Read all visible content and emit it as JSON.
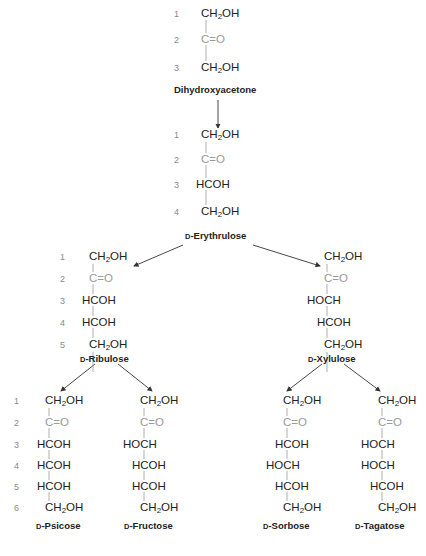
{
  "colors": {
    "text": "#222222",
    "carbonyl": "#9a9a9a",
    "carbon_numbers": "#8a8a8a",
    "arrow": "#333333"
  },
  "nodes": {
    "dihydroxyacetone": {
      "name": "Dihydroxyacetone",
      "prefix": "",
      "carbons": 3,
      "rows": [
        "CH2OH",
        "C=O",
        "CH2OH"
      ]
    },
    "erythrulose": {
      "name": "-Erythrulose",
      "prefix": "D",
      "carbons": 4,
      "rows": [
        "CH2OH",
        "C=O",
        "HCOH",
        "CH2OH"
      ]
    },
    "ribulose": {
      "name": "-Ribulose",
      "prefix": "D",
      "carbons": 5,
      "rows": [
        "CH2OH",
        "C=O",
        "HCOH",
        "HCOH",
        "CH2OH"
      ]
    },
    "xylulose": {
      "name": "-Xylulose",
      "prefix": "D",
      "carbons": 5,
      "rows": [
        "CH2OH",
        "C=O",
        "HOCH",
        "HCOH",
        "CH2OH"
      ]
    },
    "psicose": {
      "name": "-Psicose",
      "prefix": "D",
      "carbons": 6,
      "rows": [
        "CH2OH",
        "C=O",
        "HCOH",
        "HCOH",
        "HCOH",
        "CH2OH"
      ]
    },
    "fructose": {
      "name": "-Fructose",
      "prefix": "D",
      "carbons": 6,
      "rows": [
        "CH2OH",
        "C=O",
        "HOCH",
        "HCOH",
        "HCOH",
        "CH2OH"
      ]
    },
    "sorbose": {
      "name": "-Sorbose",
      "prefix": "D",
      "carbons": 6,
      "rows": [
        "CH2OH",
        "C=O",
        "HCOH",
        "HOCH",
        "HCOH",
        "CH2OH"
      ]
    },
    "tagatose": {
      "name": "-Tagatose",
      "prefix": "D",
      "carbons": 6,
      "rows": [
        "CH2OH",
        "C=O",
        "HOCH",
        "HOCH",
        "HCOH",
        "CH2OH"
      ]
    }
  },
  "carbon_numbers": [
    "1",
    "2",
    "3",
    "4",
    "5",
    "6"
  ],
  "edges": [
    [
      "dihydroxyacetone",
      "erythrulose"
    ],
    [
      "erythrulose",
      "ribulose"
    ],
    [
      "erythrulose",
      "xylulose"
    ],
    [
      "ribulose",
      "psicose"
    ],
    [
      "ribulose",
      "fructose"
    ],
    [
      "xylulose",
      "sorbose"
    ],
    [
      "xylulose",
      "tagatose"
    ]
  ]
}
